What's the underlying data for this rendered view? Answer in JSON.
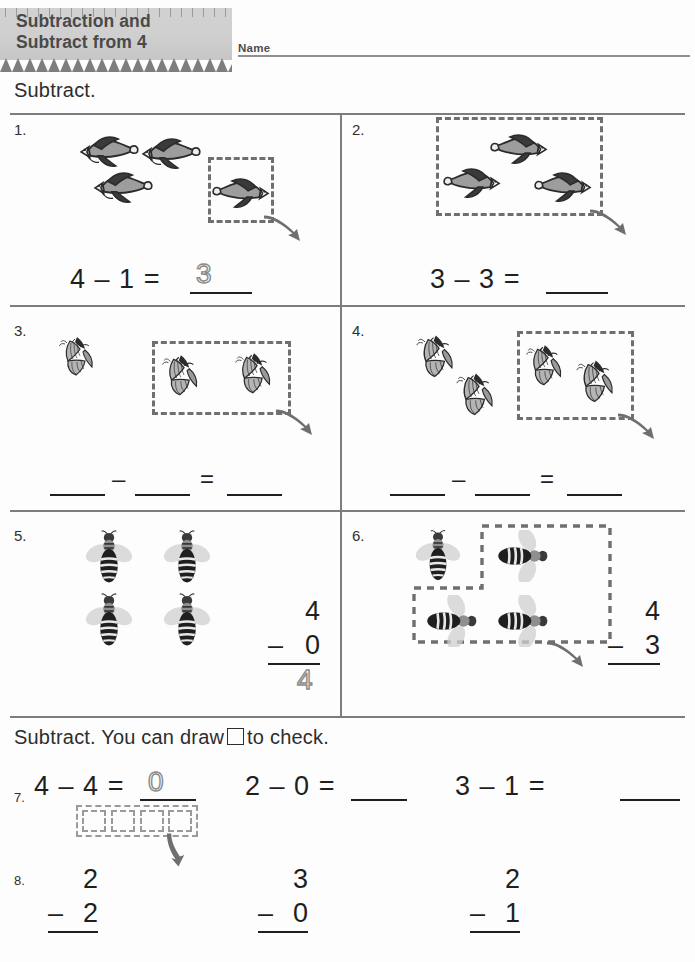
{
  "header": {
    "title_line1": "Subtraction and",
    "title_line2": "Subtract from 4",
    "name_label": "Name"
  },
  "directions": {
    "top": "Subtract.",
    "bottom_before": "Subtract. You can draw",
    "bottom_after": "to check.",
    "square_icon": "square-glyph"
  },
  "problems": [
    {
      "number": "1.",
      "object": "bird",
      "total": 4,
      "grouped": 1,
      "equation": {
        "minuend": "4",
        "operator": "–",
        "subtrahend": "1",
        "equals": "=",
        "answer": "3",
        "answer_style": "dotted"
      }
    },
    {
      "number": "2.",
      "object": "bird",
      "total": 3,
      "grouped": 3,
      "equation": {
        "minuend": "3",
        "operator": "–",
        "subtrahend": "3",
        "equals": "=",
        "answer": "",
        "answer_style": "blank"
      }
    },
    {
      "number": "3.",
      "object": "butterfly",
      "total": 3,
      "grouped": 2,
      "equation": {
        "minuend": "",
        "operator": "–",
        "subtrahend": "",
        "equals": "=",
        "answer": "",
        "answer_style": "blank-all"
      }
    },
    {
      "number": "4.",
      "object": "butterfly",
      "total": 4,
      "grouped": 2,
      "equation": {
        "minuend": "",
        "operator": "–",
        "subtrahend": "",
        "equals": "=",
        "answer": "",
        "answer_style": "blank-all"
      }
    },
    {
      "number": "5.",
      "object": "bee",
      "total": 4,
      "grouped": 0,
      "vertical": {
        "top": "4",
        "operator": "–",
        "bottom": "0",
        "answer": "4",
        "answer_style": "dotted"
      }
    },
    {
      "number": "6.",
      "object": "bee",
      "total": 4,
      "grouped": 3,
      "vertical": {
        "top": "4",
        "operator": "–",
        "bottom": "3",
        "answer": "",
        "answer_style": "blank"
      }
    }
  ],
  "row7": {
    "number": "7.",
    "items": [
      {
        "minuend": "4",
        "operator": "–",
        "subtrahend": "4",
        "equals": "=",
        "answer": "0",
        "answer_style": "dotted"
      },
      {
        "minuend": "2",
        "operator": "–",
        "subtrahend": "0",
        "equals": "=",
        "answer": "",
        "answer_style": "blank"
      },
      {
        "minuend": "3",
        "operator": "–",
        "subtrahend": "1",
        "equals": "=",
        "answer": "",
        "answer_style": "blank"
      }
    ],
    "check_squares": 4
  },
  "row8": {
    "number": "8.",
    "items": [
      {
        "top": "2",
        "operator": "–",
        "bottom": "2",
        "answer": "",
        "answer_style": "blank"
      },
      {
        "top": "3",
        "operator": "–",
        "bottom": "0",
        "answer": "",
        "answer_style": "blank"
      },
      {
        "top": "2",
        "operator": "–",
        "bottom": "1",
        "answer": "",
        "answer_style": "blank"
      }
    ]
  },
  "colors": {
    "rule": "#7d7d7d",
    "text": "#1f1f1f",
    "banner": "#cfcfcf",
    "banner_text": "#4a4a4a",
    "dash": "#6f6f6f",
    "dotted_answer": "#8a8a8a"
  }
}
